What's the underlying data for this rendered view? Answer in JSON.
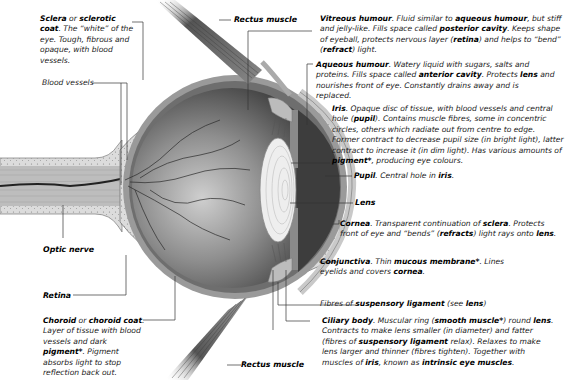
{
  "diagram": {
    "labels": {
      "sclera": {
        "term": "Sclera",
        "joiner": " or ",
        "term2": "sclerotic coat",
        "desc": ". The “white” of the eye. Tough, fibrous and opaque, with blood vessels."
      },
      "blood_vessels": {
        "text": "Blood vessels"
      },
      "optic_nerve": {
        "text": "Optic nerve"
      },
      "retina": {
        "text": "Retina"
      },
      "choroid": {
        "term": "Choroid",
        "joiner": " or ",
        "term2": "choroid coat",
        "desc1": ". Layer of tissue with blood vessels and dark ",
        "k1": "pigment*",
        "desc2": ". Pigment absorbs light to stop reflection back out."
      },
      "rectus_top": {
        "text": "Rectus muscle"
      },
      "rectus_bottom": {
        "text": "Rectus muscle"
      },
      "vitreous": {
        "term": "Vitreous humour",
        "d1": ". Fluid similar to ",
        "k1": "aqueous humour",
        "d2": ", but stiff and jelly-like. Fills space called ",
        "k2": "posterior cavity",
        "d3": ". Keeps shape of eyeball, protects nervous layer (",
        "k3": "retina",
        "d4": ") and helps to “bend” (",
        "k4": "refract",
        "d5": ") light."
      },
      "aqueous": {
        "term": "Aqueous humour",
        "d1": ". Watery liquid with sugars, salts and proteins. Fills space called ",
        "k1": "anterior cavity",
        "d2": ". Protects ",
        "k2": "lens",
        "d3": " and nourishes front of eye. Constantly drains away and is replaced."
      },
      "iris": {
        "term": "Iris",
        "d1": ". Opaque disc of tissue, with blood vessels and central hole (",
        "k1": "pupil",
        "d2": "). Contains muscle fibres, some in concentric circles, others which radiate out from centre to edge. Former contract to decrease pupil size (in bright light), latter contract to increase it (in dim light). Has various amounts of ",
        "k2": "pigment*",
        "d3": ", producing eye colours."
      },
      "pupil": {
        "term": "Pupil",
        "d1": ". Central hole in ",
        "k1": "iris",
        "d2": "."
      },
      "lens": {
        "text": "Lens"
      },
      "cornea": {
        "term": "Cornea",
        "d1": ". Transparent continuation of ",
        "k1": "sclera",
        "d2": ". Protects front of eye and “bends” (",
        "k2": "refracts",
        "d3": ") light rays onto ",
        "k3": "lens",
        "d4": "."
      },
      "conjunctiva": {
        "term": "Conjunctiva",
        "d1": ". Thin ",
        "k1": "mucous membrane*",
        "d2": ". Lines eyelids and covers ",
        "k2": "cornea",
        "d3": "."
      },
      "suspensory": {
        "d1": "Fibres of ",
        "k1": "suspensory ligament",
        "d2": " (see ",
        "k2": "lens",
        "d3": ")"
      },
      "ciliary": {
        "term": "Ciliary body",
        "d1": ". Muscular ring (",
        "k1": "smooth muscle*",
        "d2": ") round ",
        "k2": "lens",
        "d3": ". Contracts to make lens smaller (in diameter) and fatter (fibres of ",
        "k3": "suspensory ligament",
        "d4": " relax). Relaxes to make lens larger and thinner (fibres tighten). Together with muscles of ",
        "k4": "iris",
        "d5": ", known as ",
        "k5": "intrinsic eye muscles",
        "d6": "."
      }
    },
    "colors": {
      "line": "#333333",
      "sclera_fill": "#d6d6d6",
      "interior_dark": "#3a3a3a",
      "interior_light": "#a8a8a8",
      "muscle": "#6a6a6a"
    }
  }
}
